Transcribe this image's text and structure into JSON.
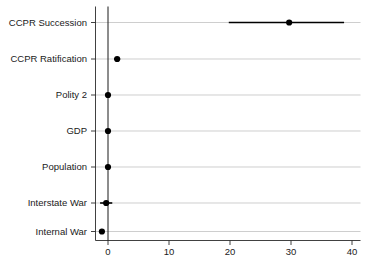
{
  "chart_data": {
    "type": "scatter",
    "subtype": "coefficient-dot-plot-with-confidence-intervals",
    "title": "",
    "subtitle": "",
    "xlabel": "",
    "ylabel": "",
    "xlim": [
      -2.2,
      42.0
    ],
    "ylim_categories_top_to_bottom": true,
    "grid": {
      "horizontal": true,
      "vertical": false
    },
    "legend": {
      "visible": false,
      "position": "none"
    },
    "reference_line": {
      "value": 0,
      "orientation": "vertical",
      "color": "#1a1a1a"
    },
    "xticks": [
      0,
      10,
      20,
      30,
      40
    ],
    "xtick_labels": [
      "0",
      "10",
      "20",
      "30",
      "40"
    ],
    "categories": [
      "CCPR Succession",
      "CCPR Ratification",
      "Polity 2",
      "GDP",
      "Population",
      "Interstate War",
      "Internal War"
    ],
    "values": [
      29.7,
      1.5,
      0.0,
      0.0,
      0.0,
      -0.3,
      -1.0
    ],
    "ci_low": [
      19.8,
      1.0,
      -0.4,
      -0.4,
      -0.4,
      -1.3,
      -1.2
    ],
    "ci_high": [
      38.7,
      2.0,
      0.4,
      0.4,
      0.4,
      0.7,
      -0.8
    ],
    "points": [
      {
        "category": "CCPR Succession",
        "estimate": 29.7,
        "ci_low": 19.8,
        "ci_high": 38.7
      },
      {
        "category": "CCPR Ratification",
        "estimate": 1.5,
        "ci_low": 1.0,
        "ci_high": 2.0
      },
      {
        "category": "Polity 2",
        "estimate": 0.0,
        "ci_low": -0.4,
        "ci_high": 0.4
      },
      {
        "category": "GDP",
        "estimate": 0.0,
        "ci_low": -0.4,
        "ci_high": 0.4
      },
      {
        "category": "Population",
        "estimate": 0.0,
        "ci_low": -0.4,
        "ci_high": 0.4
      },
      {
        "category": "Interstate War",
        "estimate": -0.3,
        "ci_low": -1.3,
        "ci_high": 0.7
      },
      {
        "category": "Internal War",
        "estimate": -1.0,
        "ci_low": -1.2,
        "ci_high": -0.8
      }
    ],
    "colors": {
      "marker": "#000000",
      "ci": "#000000",
      "grid": "#b9b9b9",
      "axis": "#2b2b2b",
      "reference": "#1a1a1a",
      "background": "#ffffff"
    }
  }
}
